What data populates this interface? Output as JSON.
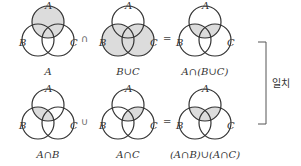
{
  "diagrams": [
    {
      "id": "A",
      "caption": "A",
      "labels": {
        "a": "A",
        "b": "B",
        "c": "C"
      },
      "shade": "A"
    },
    {
      "id": "BuC",
      "caption": "B∪C",
      "labels": {
        "a": "A",
        "b": "B",
        "c": "C"
      },
      "shade": "BuC"
    },
    {
      "id": "An(BuC)",
      "caption": "A∩(B∪C)",
      "labels": {
        "a": "A",
        "b": "B",
        "c": "C"
      },
      "shade": "An(BuC)"
    },
    {
      "id": "AnB",
      "caption": "A∩B",
      "labels": {
        "a": "A",
        "b": "B",
        "c": "C"
      },
      "shade": "AnB"
    },
    {
      "id": "AnC",
      "caption": "A∩C",
      "labels": {
        "a": "A",
        "b": "B",
        "c": "C"
      },
      "shade": "AnC"
    },
    {
      "id": "(AnB)u(AnC)",
      "caption": "(A∩B)∪(A∩C)",
      "labels": {
        "a": "A",
        "b": "B",
        "c": "C"
      },
      "shade": "An(BuC)"
    }
  ],
  "operators": {
    "row1_op1": "∩",
    "row1_op2": "=",
    "row2_op1": "∪",
    "row2_op2": "="
  },
  "bracket_label": "일치",
  "colors": {
    "shade": "#dcdcdc",
    "stroke": "#333333"
  }
}
